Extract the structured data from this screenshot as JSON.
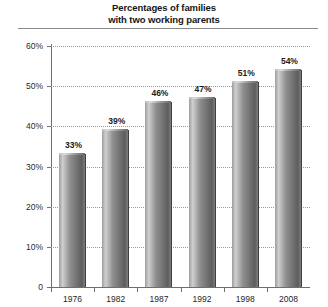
{
  "title": {
    "line1": "Percentages of families",
    "line2": "with two working parents"
  },
  "chart_data": {
    "type": "bar",
    "title": "Percentages of families with two working parents",
    "xlabel": "",
    "ylabel": "",
    "categories": [
      "1976",
      "1982",
      "1987",
      "1992",
      "1998",
      "2008"
    ],
    "values": [
      33,
      39,
      46,
      47,
      51,
      54
    ],
    "data_labels": [
      "33%",
      "39%",
      "46%",
      "47%",
      "51%",
      "54%"
    ],
    "ylim": [
      0,
      60
    ],
    "yticks": [
      0,
      10,
      20,
      30,
      40,
      50,
      60
    ],
    "ytick_labels": [
      "0",
      "10%",
      "20%",
      "30%",
      "40%",
      "50%",
      "60%"
    ],
    "grid": true,
    "grid_style": "dotted-horizontal",
    "legend": null,
    "bar_color": "#8a8a8a",
    "bar_style": "3d-cylinder-gradient",
    "units": "percent"
  }
}
